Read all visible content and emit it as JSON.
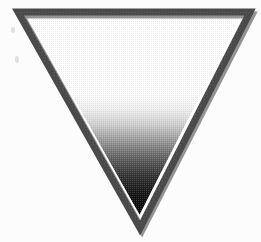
{
  "canvas": {
    "width": 261,
    "height": 242,
    "background_color": "#fcfcfc",
    "paper_tint": "#fbfbfb"
  },
  "figure": {
    "name": "inverted-triangle",
    "orientation": "point-down",
    "outline": {
      "color": "#4a4a4a",
      "shadow_color": "#3d3d3d",
      "thickness_px": 7,
      "style": "solid"
    },
    "vertices": {
      "top_left": {
        "x": 18,
        "y": 12
      },
      "top_right": {
        "x": 250,
        "y": 12
      },
      "bottom": {
        "x": 140,
        "y": 228
      }
    },
    "fill": {
      "type": "linear-gradient",
      "direction": "top-to-bottom",
      "texture": "halftone-dither",
      "stops": [
        {
          "offset": "0%",
          "color": "#ffffff"
        },
        {
          "offset": "38%",
          "color": "#fdfdfd"
        },
        {
          "offset": "46%",
          "color": "#efefef"
        },
        {
          "offset": "54%",
          "color": "#cfcfcf"
        },
        {
          "offset": "62%",
          "color": "#9a9a9a"
        },
        {
          "offset": "70%",
          "color": "#666666"
        },
        {
          "offset": "80%",
          "color": "#333333"
        },
        {
          "offset": "90%",
          "color": "#121212"
        },
        {
          "offset": "100%",
          "color": "#060606"
        }
      ]
    }
  },
  "artifacts": {
    "label": "scan specks",
    "items": [
      {
        "name": "speck-upper",
        "x": 11,
        "y": 27,
        "color": "#c9c9c9"
      },
      {
        "name": "speck-lower",
        "x": 15,
        "y": 56,
        "color": "#c9c9c9"
      }
    ]
  },
  "alt_text": "A large inverted triangle outlined in dark gray, its interior shaded with a gradient that fades from white at the wide top edge to solid black at the bottom point."
}
